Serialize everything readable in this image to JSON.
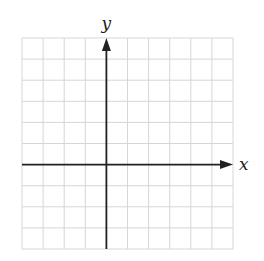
{
  "diagram": {
    "type": "coordinate-plane",
    "grid": {
      "columns": 10,
      "rows": 10,
      "left": 22,
      "top": 38,
      "cell_size": 21.1,
      "line_color": "#d6d6d6"
    },
    "axes": {
      "color": "#222222",
      "x_axis_row": 6,
      "y_axis_col": 4,
      "x_label": "x",
      "y_label": "y"
    }
  }
}
